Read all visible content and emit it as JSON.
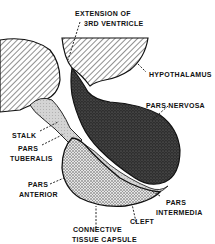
{
  "diagram": {
    "labels": {
      "extension_line1": "EXTENSION OF",
      "extension_line2": "3RD VENTRICLE",
      "hypothalamus": "HYPOTHALAMUS",
      "pars_nervosa": "PARS NERVOSA",
      "stalk": "STALK",
      "pars_tuberalis_line1": "PARS",
      "pars_tuberalis_line2": "TUBERALIS",
      "pars_anterior_line1": "PARS",
      "pars_anterior_line2": "ANTERIOR",
      "pars_intermedia_line1": "PARS",
      "pars_intermedia_line2": "INTERMEDIA",
      "cleft": "CLEFT",
      "capsule_line1": "CONNECTIVE",
      "capsule_line2": "TISSUE CAPSULE"
    },
    "colors": {
      "ink": "#111111",
      "background": "#ffffff",
      "nervosa_fill": "#3a3a3a",
      "anterior_fill": "#bdbdbd",
      "intermedia_fill": "#d8d8d8"
    }
  }
}
